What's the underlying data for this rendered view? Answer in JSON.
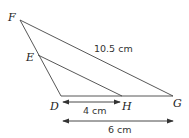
{
  "diagram": {
    "points": {
      "F": {
        "label": "F",
        "x": 20,
        "y": 20
      },
      "E": {
        "label": "E",
        "x": 38,
        "y": 55
      },
      "D": {
        "label": "D",
        "x": 61,
        "y": 96
      },
      "H": {
        "label": "H",
        "x": 122,
        "y": 96
      },
      "G": {
        "label": "G",
        "x": 173,
        "y": 96
      }
    },
    "measurements": {
      "FG": "10.5 cm",
      "DH": "4 cm",
      "DG": "6 cm"
    },
    "colors": {
      "line": "#444444",
      "text": "#222222"
    }
  }
}
